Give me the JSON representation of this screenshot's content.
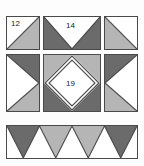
{
  "diagram": {
    "canvas": {
      "width": 144,
      "height": 166
    },
    "background_color": "#fdfdfd",
    "outline_color": "#4a4a4a",
    "colors": {
      "white": "#ffffff",
      "light_gray": "#b5b5b5",
      "dark_gray": "#6b6b6b",
      "outline": "#4a4a4a",
      "label_text": "#1a1a1a"
    },
    "labels": [
      {
        "id": "label-12",
        "text": "12",
        "block": "top-left"
      },
      {
        "id": "label-14",
        "text": "14",
        "block": "top-center"
      },
      {
        "id": "label-19",
        "text": "19",
        "block": "center"
      }
    ],
    "blocks": [
      {
        "id": "top-left",
        "name": "corner-square-half-triangle",
        "shape": "square",
        "piece_number": "12",
        "patches": [
          {
            "fill": "white",
            "position": "upper-left-triangle"
          },
          {
            "fill": "light_gray",
            "position": "lower-right-triangle"
          }
        ]
      },
      {
        "id": "top-center",
        "name": "top-flying-geese-rectangle",
        "shape": "rectangle",
        "piece_number": "14",
        "patches": [
          {
            "fill": "dark_gray",
            "position": "upper-left-corner-triangle"
          },
          {
            "fill": "dark_gray",
            "position": "upper-right-corner-triangle"
          },
          {
            "fill": "white",
            "position": "center-inverted-triangle"
          }
        ]
      },
      {
        "id": "top-right",
        "name": "corner-square-half-triangle",
        "shape": "square",
        "piece_number": "",
        "patches": [
          {
            "fill": "light_gray",
            "position": "lower-left-triangle"
          },
          {
            "fill": "white",
            "position": "upper-right-triangle"
          }
        ]
      },
      {
        "id": "middle-left",
        "name": "side-flying-geese-rectangle",
        "shape": "rectangle-vertical",
        "piece_number": "",
        "patches": [
          {
            "fill": "dark_gray",
            "position": "upper-right-corner-triangle"
          },
          {
            "fill": "light_gray",
            "position": "lower-right-corner-triangle"
          },
          {
            "fill": "white",
            "position": "center-right-pointing-triangle"
          }
        ]
      },
      {
        "id": "center",
        "name": "center-square-in-a-square",
        "shape": "square",
        "piece_number": "19",
        "patches": [
          {
            "fill": "light_gray",
            "position": "upper-left-corner-triangle"
          },
          {
            "fill": "light_gray",
            "position": "upper-right-corner-triangle"
          },
          {
            "fill": "dark_gray",
            "position": "lower-left-corner-triangle"
          },
          {
            "fill": "dark_gray",
            "position": "lower-right-corner-triangle"
          },
          {
            "fill": "white",
            "position": "center-diamond"
          }
        ]
      },
      {
        "id": "middle-right",
        "name": "side-flying-geese-rectangle",
        "shape": "rectangle-vertical",
        "piece_number": "",
        "patches": [
          {
            "fill": "dark_gray",
            "position": "upper-left-corner-triangle"
          },
          {
            "fill": "light_gray",
            "position": "lower-left-corner-triangle"
          },
          {
            "fill": "white",
            "position": "center-left-pointing-triangle"
          }
        ]
      },
      {
        "id": "bottom-strip",
        "name": "bottom-sawtooth-border-strip",
        "shape": "rectangle-wide",
        "piece_number": "",
        "patches": [
          {
            "fill": "dark_gray",
            "position": "downward-triangle-1"
          },
          {
            "fill": "light_gray",
            "position": "downward-triangle-2"
          },
          {
            "fill": "light_gray",
            "position": "downward-triangle-3"
          },
          {
            "fill": "dark_gray",
            "position": "downward-triangle-4"
          },
          {
            "fill": "white",
            "position": "upward-triangles-between"
          }
        ]
      }
    ]
  }
}
